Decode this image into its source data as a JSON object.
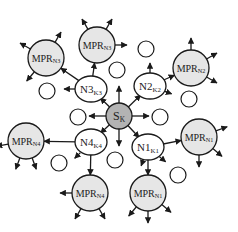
{
  "diagram": {
    "title": "",
    "colors": {
      "source_fill": "#b3b3b3",
      "mpr_fill": "#e6e6e6",
      "node_fill": "#ffffff",
      "stroke": "#1a1a1a"
    },
    "source": {
      "id": "S",
      "label": "S",
      "sub": "K",
      "x": 119,
      "y": 116,
      "r": 13
    },
    "neighbors": [
      {
        "id": "N3",
        "label": "N3",
        "sub": "K3",
        "x": 91,
        "y": 89
      },
      {
        "id": "N2",
        "label": "N2",
        "sub": "K2",
        "x": 150,
        "y": 86
      },
      {
        "id": "N4",
        "label": "N4",
        "sub": "K4",
        "x": 91,
        "y": 142
      },
      {
        "id": "N1",
        "label": "N1",
        "sub": "K1",
        "x": 148,
        "y": 147
      }
    ],
    "mprs": [
      {
        "label": "MPR",
        "sub": "N3",
        "x": 46,
        "y": 58
      },
      {
        "label": "MPR",
        "sub": "N3",
        "x": 97,
        "y": 45
      },
      {
        "label": "MPR",
        "sub": "N2",
        "x": 191,
        "y": 68
      },
      {
        "label": "MPR",
        "sub": "N4",
        "x": 26,
        "y": 141
      },
      {
        "label": "MPR",
        "sub": "N1",
        "x": 199,
        "y": 137
      },
      {
        "label": "MPR",
        "sub": "N4",
        "x": 90,
        "y": 193
      },
      {
        "label": "MPR",
        "sub": "N1",
        "x": 148,
        "y": 193
      }
    ],
    "plain_nodes": [
      {
        "x": 47,
        "y": 91
      },
      {
        "x": 78,
        "y": 117
      },
      {
        "x": 160,
        "y": 117
      },
      {
        "x": 146,
        "y": 49
      },
      {
        "x": 189,
        "y": 99
      },
      {
        "x": 117,
        "y": 70
      },
      {
        "x": 115,
        "y": 160
      },
      {
        "x": 59,
        "y": 163
      },
      {
        "x": 178,
        "y": 175
      }
    ]
  }
}
